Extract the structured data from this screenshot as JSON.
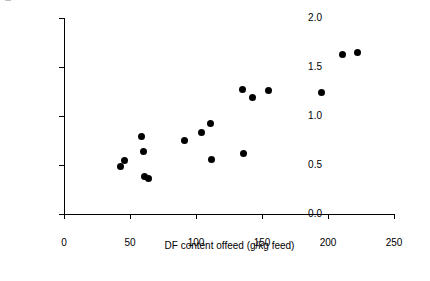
{
  "chart_data": {
    "type": "scatter",
    "title": "",
    "xlabel": "DF content offeed  (g/kg feed)",
    "ylabel": "mol SCFA produced per kg feed",
    "xlim": [
      0,
      250
    ],
    "ylim": [
      0.0,
      2.0
    ],
    "xticks": [
      "0",
      "50",
      "100",
      "150",
      "200",
      "250"
    ],
    "yticks": [
      "0.0",
      "0.5",
      "1.0",
      "1.5",
      "2.0"
    ],
    "grid": false,
    "legend": null,
    "series": [
      {
        "name": "SCFA vs DF content",
        "marker": "filled-circle",
        "color": "#000000",
        "points": [
          {
            "x": 43,
            "y": 0.48
          },
          {
            "x": 46,
            "y": 0.55
          },
          {
            "x": 59,
            "y": 0.79
          },
          {
            "x": 60,
            "y": 0.64
          },
          {
            "x": 61,
            "y": 0.38
          },
          {
            "x": 64,
            "y": 0.36
          },
          {
            "x": 91,
            "y": 0.75
          },
          {
            "x": 104,
            "y": 0.83
          },
          {
            "x": 111,
            "y": 0.92
          },
          {
            "x": 112,
            "y": 0.56
          },
          {
            "x": 135,
            "y": 1.27
          },
          {
            "x": 136,
            "y": 0.62
          },
          {
            "x": 143,
            "y": 1.19
          },
          {
            "x": 155,
            "y": 1.26
          },
          {
            "x": 195,
            "y": 1.24
          },
          {
            "x": 211,
            "y": 1.63
          },
          {
            "x": 222,
            "y": 1.65
          }
        ]
      }
    ]
  }
}
